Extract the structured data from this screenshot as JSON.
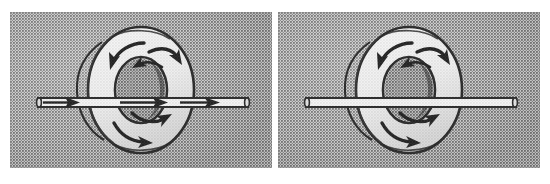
{
  "figure": {
    "type": "technical-illustration",
    "panel_count": 2,
    "background_color": "#ffffff",
    "halftone_color": "#a8a8a8",
    "ink_color": "#1a1a1a",
    "paper_color": "#f2f2f2",
    "panels": [
      {
        "id": "panel-left",
        "name": "left-panel",
        "x": 10,
        "y": 12,
        "width": 262,
        "height": 156,
        "objects": {
          "torus": {
            "name": "field-torus",
            "cx": 131,
            "cy": 78,
            "outer_rx": 53,
            "outer_ry": 63,
            "inner_rx": 26,
            "inner_ry": 33,
            "fill": "#f4f4f4",
            "stroke": "#1a1a1a",
            "circulation_arrows": 4,
            "circulation_direction": "clockwise-around-tube"
          },
          "rod": {
            "name": "conductor-rod",
            "x1": 28,
            "x2": 238,
            "cy": 90,
            "thickness": 9,
            "fill": "#fbfbfb",
            "stroke": "#1a1a1a",
            "arrowheads": 3,
            "arrow_direction": "right",
            "has_arrows": true
          }
        }
      },
      {
        "id": "panel-right",
        "name": "right-panel",
        "x": 278,
        "y": 12,
        "width": 262,
        "height": 156,
        "objects": {
          "torus": {
            "name": "field-torus",
            "cx": 131,
            "cy": 78,
            "outer_rx": 53,
            "outer_ry": 63,
            "inner_rx": 26,
            "inner_ry": 33,
            "fill": "#f4f4f4",
            "stroke": "#1a1a1a",
            "circulation_arrows": 4,
            "circulation_direction": "clockwise-around-tube"
          },
          "rod": {
            "name": "conductor-rod",
            "x1": 28,
            "x2": 238,
            "cy": 90,
            "thickness": 9,
            "fill": "#fbfbfb",
            "stroke": "#1a1a1a",
            "arrowheads": 0,
            "arrow_direction": "none",
            "has_arrows": false
          }
        }
      }
    ]
  }
}
